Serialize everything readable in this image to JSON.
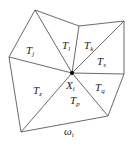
{
  "diagram": {
    "center_label": "X",
    "center_sub": "i",
    "region_label": "ω",
    "region_sub": "i",
    "triangles": [
      {
        "name": "T",
        "sub": "j",
        "x": 26,
        "y": 54
      },
      {
        "name": "T",
        "sub": "l",
        "x": 62,
        "y": 49
      },
      {
        "name": "T",
        "sub": "k",
        "x": 84,
        "y": 49
      },
      {
        "name": "T",
        "sub": "s",
        "x": 97,
        "y": 65
      },
      {
        "name": "T",
        "sub": "q",
        "x": 95,
        "y": 91
      },
      {
        "name": "T",
        "sub": "p",
        "x": 70,
        "y": 104
      },
      {
        "name": "T",
        "sub": "z",
        "x": 33,
        "y": 94
      }
    ]
  }
}
